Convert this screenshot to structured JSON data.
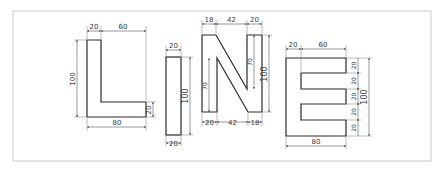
{
  "colors": {
    "background": "#ffffff",
    "frame": "#c8c8c8",
    "outline": "#2a2a2a",
    "dimension": "#555555"
  },
  "letters": [
    {
      "letter": "L",
      "dimensions": {
        "stem_width": "20",
        "top_gap": "60",
        "height": "100",
        "foot_height": "20",
        "base_width": "80"
      }
    },
    {
      "letter": "I",
      "dimensions": {
        "top_width": "20",
        "height": "100",
        "bottom_width": "20"
      }
    },
    {
      "letter": "N",
      "dimensions": {
        "top_left": "18",
        "top_middle": "42",
        "top_right": "20",
        "inner_left_height": "70",
        "inner_right_height": "70",
        "height": "100",
        "bottom_left": "20",
        "bottom_middle": "42",
        "bottom_right": "18"
      }
    },
    {
      "letter": "E",
      "dimensions": {
        "stem_width": "20",
        "arm_length": "60",
        "segment_1": "20",
        "segment_2": "20",
        "segment_3": "20",
        "segment_4": "20",
        "segment_5": "20",
        "height": "100",
        "base_width": "80"
      }
    }
  ]
}
